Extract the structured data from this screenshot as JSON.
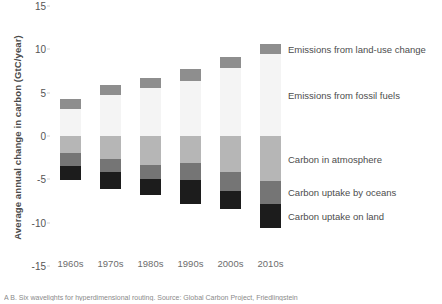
{
  "chart_data": {
    "type": "bar",
    "stacked": true,
    "title": "",
    "xlabel": "",
    "ylabel": "Average annual change in carbon (GtC/year)",
    "ylim": [
      -15,
      15
    ],
    "yticks": [
      15,
      10,
      5,
      0,
      -5,
      -10,
      -15
    ],
    "grid": false,
    "legend_position": "right",
    "categories": [
      "1960s",
      "1970s",
      "1980s",
      "1990s",
      "2000s",
      "2010s"
    ],
    "series": [
      {
        "name": "Emissions from fossil fuels",
        "color": "#f4f4f4",
        "sign": "positive",
        "values": [
          3.1,
          4.7,
          5.5,
          6.3,
          7.8,
          9.5
        ]
      },
      {
        "name": "Emissions from land-use change",
        "color": "#8e8e8e",
        "sign": "positive",
        "values": [
          1.2,
          1.2,
          1.2,
          1.4,
          1.3,
          1.1
        ]
      },
      {
        "name": "Carbon in atmosphere",
        "color": "#b6b6b6",
        "sign": "negative",
        "values": [
          -2.0,
          -2.6,
          -3.4,
          -3.1,
          -4.1,
          -5.2
        ]
      },
      {
        "name": "Carbon uptake by oceans",
        "color": "#757575",
        "sign": "negative",
        "values": [
          -1.5,
          -1.6,
          -1.6,
          -2.0,
          -2.2,
          -2.6
        ]
      },
      {
        "name": "Carbon uptake on land",
        "color": "#1c1c1c",
        "sign": "negative",
        "values": [
          -1.6,
          -1.9,
          -1.8,
          -2.7,
          -2.1,
          -2.8
        ]
      }
    ]
  },
  "axis": {
    "ytick_labels": [
      "15",
      "10",
      "5",
      "0",
      "-5",
      "-10",
      "-15"
    ],
    "xtick_labels": [
      "1960s",
      "1970s",
      "1980s",
      "1990s",
      "2000s",
      "2010s"
    ],
    "ylabel": "Average annual change in carbon (GtC/year)"
  },
  "legend": {
    "items": [
      {
        "label": "Emissions from fossil fuels",
        "color": "#f4f4f4"
      },
      {
        "label": "Emissions from land-use change",
        "color": "#8e8e8e"
      },
      {
        "label": "Carbon in atmosphere",
        "color": "#b6b6b6"
      },
      {
        "label": "Carbon uptake by oceans",
        "color": "#757575"
      },
      {
        "label": "Carbon uptake on land",
        "color": "#1c1c1c"
      }
    ]
  },
  "caption": {
    "text": "A B. Six wavelights for hyperdimensional routing. Source: Global Carbon Project, Friedlingstein"
  }
}
